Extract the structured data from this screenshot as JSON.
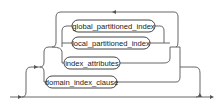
{
  "diagram": {
    "type": "railroad-syntax",
    "nodes": [
      {
        "id": "global_partitioned_index",
        "label": "global_partitioned_index"
      },
      {
        "id": "local_partitioned_index",
        "label": "local_partitioned_index"
      },
      {
        "id": "index_attributes",
        "label": "index_attributes"
      },
      {
        "id": "domain_index_clause",
        "label": "domain_index_clause"
      }
    ],
    "structure": {
      "optional_group": true,
      "choice": [
        "repeatable_group",
        "domain_index_clause"
      ],
      "repeatable_group": {
        "choice": [
          "global_partitioned_index",
          "local_partitioned_index",
          "index_attributes"
        ],
        "loop": true
      }
    }
  }
}
